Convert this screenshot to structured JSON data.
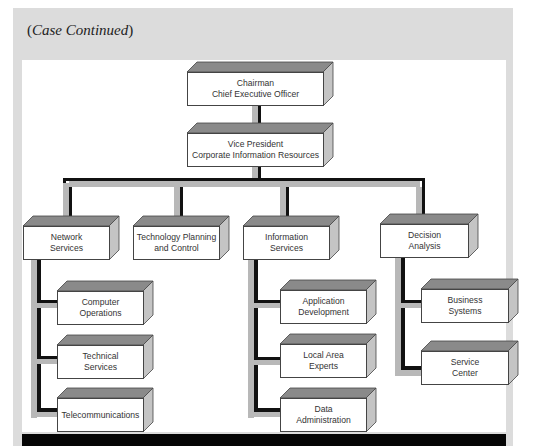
{
  "header": {
    "open": "(",
    "label": "Case Continued",
    "close": ")"
  },
  "chart": {
    "top": {
      "line1": "Chairman",
      "line2": "Chief Executive Officer"
    },
    "vp": {
      "line1": "Vice President",
      "line2": "Corporate Information Resources"
    },
    "departments": [
      {
        "line1": "Network",
        "line2": "Services"
      },
      {
        "line1": "Technology Planning",
        "line2": "and Control"
      },
      {
        "line1": "Information",
        "line2": "Services"
      },
      {
        "line1": "Decision",
        "line2": "Analysis"
      }
    ],
    "network_children": [
      {
        "line1": "Computer",
        "line2": "Operations"
      },
      {
        "line1": "Technical",
        "line2": "Services"
      },
      {
        "line1": "Telecommunications",
        "line2": ""
      }
    ],
    "info_children": [
      {
        "line1": "Application",
        "line2": "Development"
      },
      {
        "line1": "Local Area",
        "line2": "Experts"
      },
      {
        "line1": "Data",
        "line2": "Administration"
      }
    ],
    "decision_children": [
      {
        "line1": "Business",
        "line2": "Systems"
      },
      {
        "line1": "Service",
        "line2": "Center"
      }
    ]
  },
  "colors": {
    "panel": "#dcdcdc",
    "connector_gray": "#b8b8b8",
    "connector_black": "#111111",
    "box_top": "#8a8a8a",
    "box_side": "#c4c4c4"
  }
}
